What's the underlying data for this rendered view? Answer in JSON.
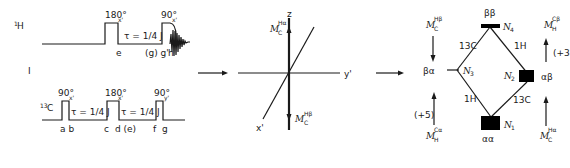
{
  "figure_label": "I",
  "pulse_sequence": {
    "h_channel": {
      "label": "1H",
      "label_sup": "1",
      "label_main": "H",
      "pulse1": {
        "angle": "180°",
        "phase": "x'"
      },
      "pulse2": {
        "angle": "90°",
        "phase": "x'"
      },
      "delay": "τ = 1/4 J",
      "markers": [
        "e",
        "(g) g'",
        "h"
      ]
    },
    "c_channel": {
      "label": "13C",
      "label_sup": "13",
      "label_main": "C",
      "pulse1": {
        "angle": "90°",
        "phase": "x'"
      },
      "pulse2": {
        "angle": "180°",
        "phase": "x'"
      },
      "pulse3": {
        "angle": "90°",
        "phase": "y'"
      },
      "delay1": "τ = 1/4 J",
      "delay2": "τ = 1/4 J",
      "markers": [
        "a b",
        "c",
        "d (e)",
        "f",
        "g"
      ]
    }
  },
  "vector_diagram": {
    "axes": {
      "z": "z",
      "x": "x'",
      "y": "y'"
    },
    "vector_up": {
      "main": "M",
      "sub": "C",
      "sup": "Hα"
    },
    "vector_down": {
      "main": "M",
      "sub": "C",
      "sup": "Hβ"
    }
  },
  "energy_diagram": {
    "levels": [
      {
        "id": "N1",
        "state": "αα",
        "label": "N",
        "sub": "1"
      },
      {
        "id": "N2",
        "state": "αβ",
        "label": "N",
        "sub": "2"
      },
      {
        "id": "N3",
        "state": "βα",
        "label": "N",
        "sub": "3"
      },
      {
        "id": "N4",
        "state": "ββ",
        "label": "N",
        "sub": "4"
      }
    ],
    "transitions": [
      {
        "from": "N3",
        "to": "N4",
        "label": "13C"
      },
      {
        "from": "N2",
        "to": "N4",
        "label": "1H"
      },
      {
        "from": "N1",
        "to": "N3",
        "label": "1H"
      },
      {
        "from": "N1",
        "to": "N2",
        "label": "13C"
      }
    ],
    "magnetizations": {
      "top_left": {
        "main": "M",
        "sub": "C",
        "sup": "Hβ",
        "direction": "down"
      },
      "top_right": {
        "main": "M",
        "sub": "H",
        "sup": "Cβ",
        "direction": "up",
        "factor": "(+3"
      },
      "bottom_left": {
        "main": "M",
        "sub": "H",
        "sup": "Cα",
        "direction": "up",
        "factor": "(+5)"
      },
      "bottom_right": {
        "main": "M",
        "sub": "C",
        "sup": "Hα",
        "direction": "up"
      }
    }
  },
  "arrows": [
    "arrow-sequence-to-vector",
    "arrow-vector-to-energy"
  ]
}
